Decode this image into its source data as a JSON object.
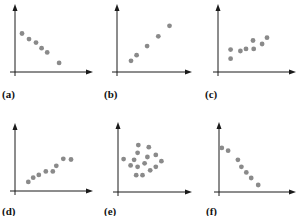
{
  "chart_data": [
    {
      "type": "scatter",
      "label": "(a)",
      "trend": "negative linear",
      "xlim": [
        0,
        10
      ],
      "ylim": [
        0,
        10
      ],
      "points": [
        [
          1,
          5.5
        ],
        [
          2,
          4.7
        ],
        [
          3,
          4.2
        ],
        [
          3.8,
          3.4
        ],
        [
          4.6,
          2.8
        ],
        [
          6.3,
          1.3
        ]
      ]
    },
    {
      "type": "scatter",
      "label": "(b)",
      "trend": "positive linear",
      "xlim": [
        0,
        10
      ],
      "ylim": [
        0,
        10
      ],
      "points": [
        [
          2,
          1.6
        ],
        [
          2.8,
          2.4
        ],
        [
          4.3,
          3.7
        ],
        [
          5.9,
          5.1
        ],
        [
          7.5,
          6.6
        ]
      ]
    },
    {
      "type": "scatter",
      "label": "(c)",
      "trend": "weak positive",
      "xlim": [
        0,
        10
      ],
      "ylim": [
        0,
        10
      ],
      "points": [
        [
          1.8,
          3.2
        ],
        [
          1.8,
          1.9
        ],
        [
          3.2,
          3.0
        ],
        [
          4.0,
          3.3
        ],
        [
          5.0,
          4.5
        ],
        [
          5.1,
          3.3
        ],
        [
          6.3,
          4.0
        ],
        [
          7.0,
          4.9
        ]
      ]
    },
    {
      "type": "scatter",
      "label": "(d)",
      "trend": "positive",
      "xlim": [
        0,
        10
      ],
      "ylim": [
        0,
        10
      ],
      "points": [
        [
          1.9,
          1.3
        ],
        [
          2.6,
          1.9
        ],
        [
          3.4,
          2.3
        ],
        [
          4.4,
          2.8
        ],
        [
          5.4,
          2.8
        ],
        [
          5.9,
          3.6
        ],
        [
          6.9,
          4.6
        ],
        [
          8.0,
          4.5
        ]
      ]
    },
    {
      "type": "scatter",
      "label": "(e)",
      "trend": "no correlation",
      "xlim": [
        0,
        10
      ],
      "ylim": [
        0,
        10
      ],
      "points": [
        [
          2.9,
          6.7
        ],
        [
          4.4,
          6.4
        ],
        [
          2.8,
          5.6
        ],
        [
          4.2,
          5.0
        ],
        [
          5.4,
          5.3
        ],
        [
          0.8,
          4.7
        ],
        [
          2.3,
          4.6
        ],
        [
          6.2,
          4.4
        ],
        [
          1.8,
          3.8
        ],
        [
          2.8,
          3.6
        ],
        [
          3.8,
          4.1
        ],
        [
          5.4,
          3.6
        ],
        [
          4.6,
          3.1
        ],
        [
          2.6,
          2.4
        ],
        [
          3.5,
          2.4
        ]
      ]
    },
    {
      "type": "scatter",
      "label": "(f)",
      "trend": "negative linear",
      "xlim": [
        0,
        10
      ],
      "ylim": [
        0,
        10
      ],
      "points": [
        [
          0.4,
          6.3
        ],
        [
          1.3,
          5.9
        ],
        [
          2.7,
          4.6
        ],
        [
          3.2,
          3.6
        ],
        [
          3.9,
          2.8
        ],
        [
          4.6,
          2.0
        ],
        [
          5.6,
          1.0
        ]
      ]
    }
  ]
}
